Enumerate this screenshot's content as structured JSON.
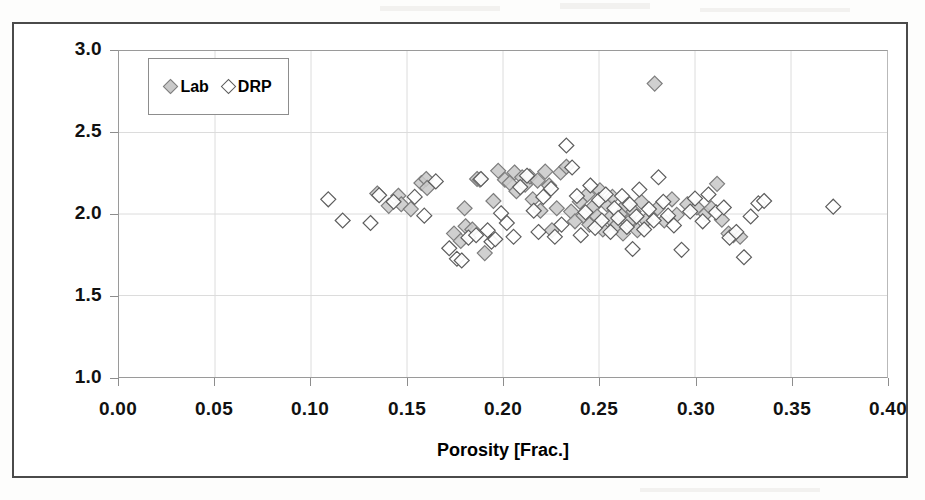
{
  "figure": {
    "type": "scatter-chart",
    "background": "#ffffff",
    "frame_color": "#4a4a4a"
  },
  "legend": {
    "position": "top-left-inside",
    "entries": [
      {
        "label": "Lab",
        "marker": "filled-diamond",
        "fill": "#c9c9c9",
        "stroke": "#7d7d7d"
      },
      {
        "label": "DRP",
        "marker": "open-diamond",
        "fill": "#ffffff",
        "stroke": "#5d5d5d"
      }
    ]
  },
  "axes": {
    "x_title": "Porosity [Frac.]",
    "y_title_main": "Saturation Exp. (n",
    "y_title_sub": "PD",
    "y_title_tail": ")",
    "x_ticks": [
      "0.00",
      "0.05",
      "0.10",
      "0.15",
      "0.20",
      "0.25",
      "0.30",
      "0.35",
      "0.40"
    ],
    "y_ticks": [
      "1.0",
      "1.5",
      "2.0",
      "2.5",
      "3.0"
    ]
  },
  "chart_data": {
    "type": "scatter",
    "title": "",
    "xlabel": "Porosity [Frac.]",
    "ylabel": "Saturation Exp. (nPD)",
    "xlim": [
      0.0,
      0.4
    ],
    "ylim": [
      1.0,
      3.0
    ],
    "xticks": [
      0.0,
      0.05,
      0.1,
      0.15,
      0.2,
      0.25,
      0.3,
      0.35,
      0.4
    ],
    "yticks": [
      1.0,
      1.5,
      2.0,
      2.5,
      3.0
    ],
    "grid": true,
    "grid_style": "faint solid gridlines at major ticks",
    "legend_position": "upper left inside axes",
    "marker_shape": "diamond",
    "marker_size_px": 15,
    "series": [
      {
        "name": "Lab",
        "fill": "#c9c9c9",
        "stroke": "#7d7d7d",
        "points": [
          [
            0.1345,
            2.126
          ],
          [
            0.1405,
            2.05
          ],
          [
            0.1455,
            2.112
          ],
          [
            0.147,
            2.06
          ],
          [
            0.152,
            2.03
          ],
          [
            0.1575,
            2.19
          ],
          [
            0.16,
            2.215
          ],
          [
            0.1605,
            2.16
          ],
          [
            0.1745,
            1.88
          ],
          [
            0.178,
            1.835
          ],
          [
            0.18,
            2.035
          ],
          [
            0.1805,
            1.925
          ],
          [
            0.184,
            1.905
          ],
          [
            0.1865,
            2.215
          ],
          [
            0.188,
            2.21
          ],
          [
            0.1905,
            1.76
          ],
          [
            0.195,
            2.08
          ],
          [
            0.1975,
            2.265
          ],
          [
            0.201,
            2.21
          ],
          [
            0.2035,
            2.19
          ],
          [
            0.206,
            2.255
          ],
          [
            0.207,
            2.14
          ],
          [
            0.21,
            2.225
          ],
          [
            0.2115,
            2.18
          ],
          [
            0.214,
            2.23
          ],
          [
            0.2155,
            2.09
          ],
          [
            0.218,
            2.205
          ],
          [
            0.2195,
            2.02
          ],
          [
            0.222,
            2.26
          ],
          [
            0.224,
            2.175
          ],
          [
            0.2255,
            1.9
          ],
          [
            0.228,
            2.035
          ],
          [
            0.23,
            2.255
          ],
          [
            0.233,
            2.29
          ],
          [
            0.2355,
            2.015
          ],
          [
            0.2375,
            1.955
          ],
          [
            0.24,
            2.075
          ],
          [
            0.242,
            1.99
          ],
          [
            0.244,
            2.12
          ],
          [
            0.245,
            1.935
          ],
          [
            0.247,
            2.045
          ],
          [
            0.249,
            1.985
          ],
          [
            0.2505,
            2.145
          ],
          [
            0.252,
            1.905
          ],
          [
            0.254,
            2.06
          ],
          [
            0.2555,
            1.975
          ],
          [
            0.257,
            2.105
          ],
          [
            0.259,
            1.93
          ],
          [
            0.261,
            2.0
          ],
          [
            0.2625,
            1.88
          ],
          [
            0.264,
            2.055
          ],
          [
            0.266,
            1.955
          ],
          [
            0.268,
            2.015
          ],
          [
            0.27,
            1.9
          ],
          [
            0.272,
            2.075
          ],
          [
            0.2745,
            1.96
          ],
          [
            0.279,
            2.8
          ],
          [
            0.2805,
            2.035
          ],
          [
            0.284,
            1.96
          ],
          [
            0.288,
            2.09
          ],
          [
            0.2905,
            1.995
          ],
          [
            0.296,
            2.06
          ],
          [
            0.301,
            2.04
          ],
          [
            0.3055,
            2.0
          ],
          [
            0.3085,
            2.035
          ],
          [
            0.3115,
            2.185
          ],
          [
            0.314,
            1.965
          ],
          [
            0.3175,
            1.88
          ],
          [
            0.32,
            1.87
          ],
          [
            0.3235,
            1.86
          ]
        ]
      },
      {
        "name": "DRP",
        "fill": "#ffffff",
        "stroke": "#5d5d5d",
        "points": [
          [
            0.109,
            2.09
          ],
          [
            0.1165,
            1.96
          ],
          [
            0.131,
            1.945
          ],
          [
            0.1355,
            2.115
          ],
          [
            0.143,
            2.075
          ],
          [
            0.154,
            2.105
          ],
          [
            0.159,
            1.99
          ],
          [
            0.165,
            2.2
          ],
          [
            0.172,
            1.79
          ],
          [
            0.176,
            1.725
          ],
          [
            0.1785,
            1.715
          ],
          [
            0.182,
            1.855
          ],
          [
            0.186,
            1.87
          ],
          [
            0.1885,
            2.215
          ],
          [
            0.192,
            1.9
          ],
          [
            0.194,
            1.83
          ],
          [
            0.196,
            1.845
          ],
          [
            0.199,
            2.005
          ],
          [
            0.202,
            1.945
          ],
          [
            0.2055,
            1.86
          ],
          [
            0.209,
            2.165
          ],
          [
            0.2125,
            2.235
          ],
          [
            0.216,
            2.02
          ],
          [
            0.2185,
            1.89
          ],
          [
            0.221,
            2.105
          ],
          [
            0.225,
            2.155
          ],
          [
            0.227,
            1.86
          ],
          [
            0.2305,
            1.935
          ],
          [
            0.233,
            2.42
          ],
          [
            0.236,
            2.285
          ],
          [
            0.2385,
            2.11
          ],
          [
            0.2405,
            1.87
          ],
          [
            0.243,
            2.01
          ],
          [
            0.2455,
            2.175
          ],
          [
            0.248,
            1.915
          ],
          [
            0.25,
            2.085
          ],
          [
            0.2515,
            1.96
          ],
          [
            0.2535,
            2.12
          ],
          [
            0.256,
            1.89
          ],
          [
            0.258,
            2.035
          ],
          [
            0.26,
            1.975
          ],
          [
            0.262,
            2.11
          ],
          [
            0.2645,
            1.92
          ],
          [
            0.266,
            2.06
          ],
          [
            0.2675,
            1.785
          ],
          [
            0.2695,
            1.985
          ],
          [
            0.271,
            2.15
          ],
          [
            0.2735,
            1.905
          ],
          [
            0.276,
            2.03
          ],
          [
            0.2785,
            1.96
          ],
          [
            0.281,
            2.225
          ],
          [
            0.2835,
            2.075
          ],
          [
            0.286,
            1.99
          ],
          [
            0.289,
            1.93
          ],
          [
            0.293,
            1.78
          ],
          [
            0.2975,
            2.015
          ],
          [
            0.3,
            2.095
          ],
          [
            0.304,
            1.955
          ],
          [
            0.307,
            2.12
          ],
          [
            0.311,
            2.01
          ],
          [
            0.315,
            2.04
          ],
          [
            0.318,
            1.855
          ],
          [
            0.3215,
            1.89
          ],
          [
            0.3255,
            1.735
          ],
          [
            0.329,
            1.985
          ],
          [
            0.333,
            2.065
          ],
          [
            0.336,
            2.08
          ],
          [
            0.372,
            2.045
          ]
        ]
      }
    ]
  }
}
